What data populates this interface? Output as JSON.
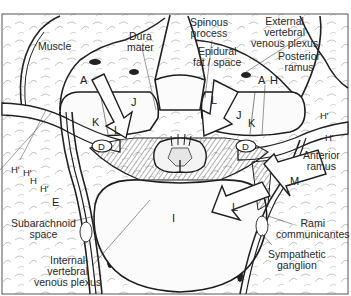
{
  "figure": {
    "frame_color": "#555555",
    "ink_color": "#222222",
    "background": "#ffffff"
  },
  "labels": {
    "muscle": "Muscle",
    "dura_mater_1": "Dura",
    "dura_mater_2": "mater",
    "spinous_process_1": "Spinous",
    "spinous_process_2": "process",
    "epidural_1": "Epidural",
    "epidural_2": "fat / space",
    "external_plexus_1": "External",
    "external_plexus_2": "vertebral",
    "external_plexus_3": "venous plexus",
    "posterior_ramus_1": "Posterior",
    "posterior_ramus_2": "ramus",
    "anterior_ramus_1": "Anterior",
    "anterior_ramus_2": "ramus",
    "subarachnoid_1": "Subarachnoid",
    "subarachnoid_2": "space",
    "internal_plexus_1": "Internal",
    "internal_plexus_2": "vertebral",
    "internal_plexus_3": "venous plexus",
    "rami_1": "Rami",
    "rami_2": "communicantes",
    "sympathetic_1": "Sympathetic",
    "sympathetic_2": "ganglion"
  },
  "letters": {
    "A_left": "A",
    "A_right": "A",
    "H_right": "H",
    "J_left": "J",
    "J_right": "J",
    "K_left": "K",
    "K_right": "K",
    "L_top_left": "L",
    "L_top_right": "L",
    "L_bottom": "L",
    "D_left": "D",
    "D_right": "D",
    "E": "E",
    "I": "I",
    "M": "M",
    "H1_right_top": "H'",
    "H1_right_mid": "H'",
    "H1_left_a": "H'",
    "H1_left_b": "H'",
    "H_left": "H",
    "H1_left_c": "H'"
  }
}
